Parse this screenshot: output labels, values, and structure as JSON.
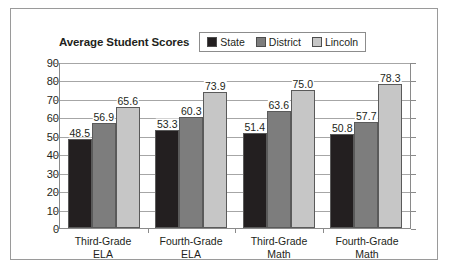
{
  "chart": {
    "title": "Average Student Scores"
  },
  "legend": {
    "items": [
      {
        "label": "State",
        "color": "#231f20"
      },
      {
        "label": "District",
        "color": "#7d7d7d"
      },
      {
        "label": "Lincoln",
        "color": "#c6c6c6"
      }
    ]
  },
  "chart_data": {
    "type": "bar",
    "title": "Average Student Scores",
    "xlabel": "",
    "ylabel": "",
    "ylim": [
      0,
      90
    ],
    "yticks": [
      0,
      10,
      20,
      30,
      40,
      50,
      60,
      70,
      80,
      90
    ],
    "grid": true,
    "legend_position": "top-right",
    "categories": [
      "Third-Grade ELA",
      "Fourth-Grade ELA",
      "Third-Grade Math",
      "Fourth-Grade Math"
    ],
    "category_lines": [
      [
        "Third-Grade",
        "ELA"
      ],
      [
        "Fourth-Grade",
        "ELA"
      ],
      [
        "Third-Grade",
        "Math"
      ],
      [
        "Fourth-Grade",
        "Math"
      ]
    ],
    "series": [
      {
        "name": "State",
        "color": "#231f20",
        "values": [
          48.5,
          53.3,
          51.4,
          50.8
        ]
      },
      {
        "name": "District",
        "color": "#7d7d7d",
        "values": [
          56.9,
          60.3,
          63.6,
          57.7
        ]
      },
      {
        "name": "Lincoln",
        "color": "#c6c6c6",
        "values": [
          65.6,
          73.9,
          75.0,
          78.3
        ]
      }
    ],
    "value_labels": [
      [
        "48.5",
        "56.9",
        "65.6"
      ],
      [
        "53.3",
        "60.3",
        "73.9"
      ],
      [
        "51.4",
        "63.6",
        "75.0"
      ],
      [
        "50.8",
        "57.7",
        "78.3"
      ]
    ]
  }
}
